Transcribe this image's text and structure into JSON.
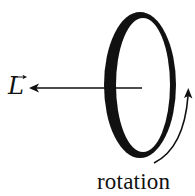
{
  "diagram": {
    "vector_label": "L",
    "vector_symbol": "vector-arrow",
    "rotation_label": "rotation",
    "colors": {
      "stroke": "#111111",
      "background": "#ffffff"
    }
  }
}
